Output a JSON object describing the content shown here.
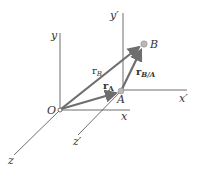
{
  "diagram": {
    "colors": {
      "axis": "#4a4a4a",
      "vector": "#6e6e6e",
      "point_fill": "#b8b8b8",
      "label": "#333333"
    },
    "axes": {
      "fixed": {
        "x": "x",
        "y": "y",
        "z": "z",
        "origin": "O"
      },
      "translating": {
        "x": "x′",
        "y": "y′",
        "z": "z′"
      }
    },
    "points": {
      "A": "A",
      "B": "B"
    },
    "vectors": {
      "rA": {
        "base": "r",
        "sub": "A"
      },
      "rB": {
        "base": "r",
        "sub": "B"
      },
      "rBA": {
        "base": "r",
        "sub": "B/A"
      }
    }
  }
}
